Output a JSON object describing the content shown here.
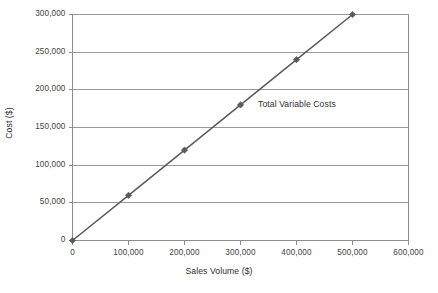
{
  "chart_data": {
    "type": "line",
    "title": "",
    "xlabel": "Sales Volume ($)",
    "ylabel": "Cost ($)",
    "xlim": [
      0,
      600000
    ],
    "ylim": [
      0,
      300000
    ],
    "grid": "horizontal",
    "legend_position": "none",
    "xticks": [
      0,
      100000,
      200000,
      300000,
      400000,
      500000,
      600000
    ],
    "xtick_labels": [
      "0",
      "100,000",
      "200,000",
      "300,000",
      "400,000",
      "500,000",
      "600,000"
    ],
    "yticks": [
      0,
      50000,
      100000,
      150000,
      200000,
      250000,
      300000
    ],
    "ytick_labels": [
      "0",
      "50,000",
      "100,000",
      "150,000",
      "200,000",
      "250,000",
      "300,000"
    ],
    "series": [
      {
        "name": "Total Variable Costs",
        "marker": "diamond",
        "color": "#5a5a5a",
        "x": [
          0,
          100000,
          200000,
          300000,
          400000,
          500000
        ],
        "values": [
          0,
          60000,
          120000,
          180000,
          240000,
          300000
        ]
      }
    ],
    "annotations": [
      {
        "text": "Total Variable Costs",
        "x": 370000,
        "y": 165000
      }
    ],
    "colors": {
      "line": "#5a5a5a",
      "gridline": "#9a9a9a",
      "axis": "#8c8c8c",
      "text": "#3a3a3a",
      "background": "#ffffff"
    }
  }
}
